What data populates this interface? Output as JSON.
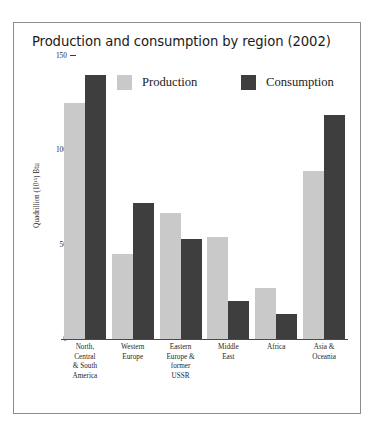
{
  "chart_data": {
    "type": "bar",
    "title": "Production and consumption by region (2002)",
    "xlabel": "",
    "ylabel": "Quadrillion (10¹⁵) Btu",
    "ylim": [
      0,
      150
    ],
    "yticks": [
      0,
      50,
      100,
      150
    ],
    "ytick_labels": [
      "0",
      "50",
      "100",
      "150"
    ],
    "grid": false,
    "legend_position": "top",
    "categories": [
      "North, Central & South America",
      "Western Europe",
      "Eastern Europe & former USSR",
      "Middle East",
      "Africa",
      "Asia & Oceania"
    ],
    "category_lines": [
      [
        "North,",
        "Central",
        "& South",
        "America"
      ],
      [
        "Western",
        "Europe"
      ],
      [
        "Eastern",
        "Europe &",
        "former",
        "USSR"
      ],
      [
        "Middle",
        "East"
      ],
      [
        "Africa"
      ],
      [
        "Asia &",
        "Oceania"
      ]
    ],
    "series": [
      {
        "name": "Production",
        "color": "#c9c9c9",
        "values": [
          125,
          45,
          67,
          54,
          27,
          89
        ]
      },
      {
        "name": "Consumption",
        "color": "#3e3e3e",
        "values": [
          140,
          72,
          53,
          20,
          13,
          119
        ]
      }
    ]
  },
  "legend": {
    "items": [
      {
        "label": "Production",
        "swatch": "production"
      },
      {
        "label": "Consumption",
        "swatch": "consumption"
      }
    ]
  },
  "colors": {
    "production": "#c9c9c9",
    "consumption": "#3e3e3e",
    "frame": "#8d8d8d",
    "axis": "#4a4a4a",
    "text": "#1a1a1a",
    "background": "#ffffff"
  }
}
